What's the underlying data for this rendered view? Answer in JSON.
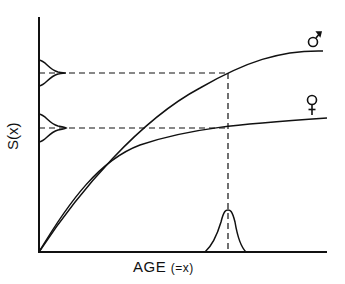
{
  "axes": {
    "x_label": "AGE",
    "x_label_note": "(=x)",
    "y_label": "S(x)"
  },
  "curves": [
    {
      "name": "male",
      "symbol": "♂",
      "description": "upper saturating curve"
    },
    {
      "name": "female",
      "symbol": "♀",
      "description": "lower saturating curve"
    }
  ],
  "annotations": {
    "y_distributions": [
      "distribution at male plateau level",
      "distribution at female plateau level"
    ],
    "x_distribution": "age distribution peak",
    "dashed_guides": [
      "horizontal guide from male curve",
      "horizontal guide from female curve",
      "vertical guide at peak age"
    ]
  },
  "colors": {
    "ink": "#111111",
    "background": "#ffffff"
  }
}
